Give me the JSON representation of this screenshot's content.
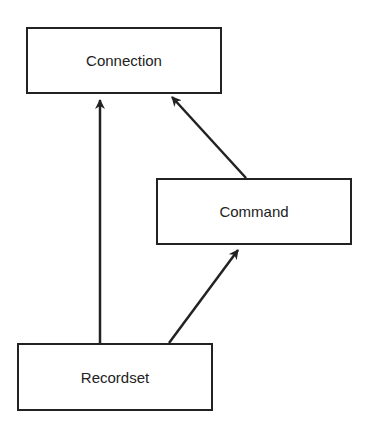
{
  "diagram": {
    "nodes": [
      {
        "id": "connection",
        "label": "Connection"
      },
      {
        "id": "command",
        "label": "Command"
      },
      {
        "id": "recordset",
        "label": "Recordset"
      }
    ],
    "edges": [
      {
        "from": "command",
        "to": "connection"
      },
      {
        "from": "recordset",
        "to": "connection"
      },
      {
        "from": "recordset",
        "to": "command"
      }
    ],
    "colors": {
      "stroke": "#222222",
      "background": "#ffffff"
    }
  }
}
